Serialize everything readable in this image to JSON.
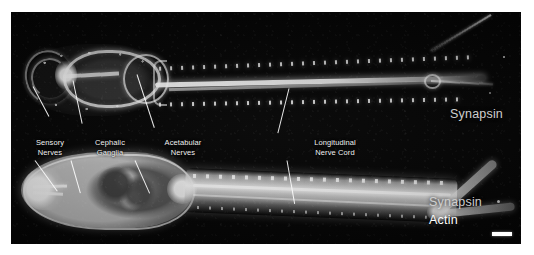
{
  "figure": {
    "type": "confocal-fluorescence-micrograph",
    "panel_background": "#040404",
    "page_background": "#ffffff",
    "specimens": [
      {
        "id": "top",
        "position": "upper",
        "channels": [
          "Synapsin"
        ],
        "description": "Synapsin-immunoreactive nervous system of a flatworm: cephalic ganglia ring, sensory nerves, acetabular nerves and paired longitudinal nerve cords"
      },
      {
        "id": "bottom",
        "position": "lower",
        "channels": [
          "Synapsin",
          "Actin"
        ],
        "description": "Double-label preparation showing synapsin plus phalloidin-stained actin musculature of the whole body"
      }
    ]
  },
  "annotations": [
    {
      "id": "sensory-nerves",
      "label": "Sensory\nNerves",
      "color": "#f2f2f2"
    },
    {
      "id": "cephalic-ganglia",
      "label": "Cephalic\nGanglia",
      "color": "#f2f2f2"
    },
    {
      "id": "acetabular-nerves",
      "label": "Acetabular\nNerves",
      "color": "#f2f2f2"
    },
    {
      "id": "longitudinal-nerve-cord",
      "label": "Longitudinal\nNerve Cord",
      "color": "#f2f2f2"
    }
  ],
  "channel_labels": {
    "top": {
      "text": "Synapsin",
      "color": "#cfcfcf"
    },
    "bottom_primary": {
      "text": "Synapsin",
      "color": "#cfcfcf"
    },
    "bottom_secondary": {
      "text": "Actin",
      "color": "#fdfdfd"
    }
  },
  "scale_bar": {
    "present": true,
    "color": "#ffffff",
    "position": "bottom-right"
  }
}
